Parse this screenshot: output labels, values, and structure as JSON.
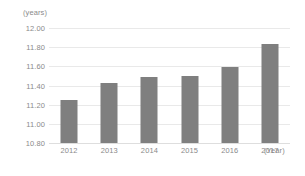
{
  "chart_data": {
    "type": "bar",
    "title": "",
    "subtitle": "",
    "xlabel": "(Year)",
    "ylabel": "(years)",
    "categories": [
      "2012",
      "2013",
      "2014",
      "2015",
      "2016",
      "2017"
    ],
    "values": [
      11.25,
      11.43,
      11.49,
      11.5,
      11.59,
      11.83
    ],
    "series": [
      {
        "name": "",
        "values": [
          11.25,
          11.43,
          11.49,
          11.5,
          11.59,
          11.83
        ]
      }
    ],
    "ylim": [
      10.8,
      12.0
    ],
    "ytick_labels": [
      "12.00",
      "11.80",
      "11.60",
      "11.40",
      "11.20",
      "11.00",
      "10.80"
    ],
    "ytick_values": [
      12.0,
      11.8,
      11.6,
      11.4,
      11.2,
      11.0,
      10.8
    ],
    "grid": true,
    "legend": false,
    "legend_position": "none",
    "bar_color": "#7f7f7f",
    "gridline_color": "#e9e9e9",
    "text_color": "#8a8a8a",
    "background_color": "#ffffff",
    "annotations": []
  }
}
